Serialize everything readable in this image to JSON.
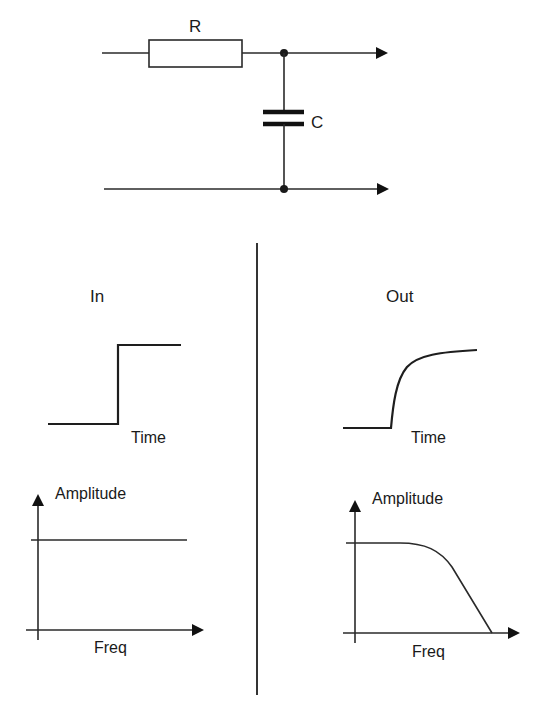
{
  "circuit": {
    "resistor_label": "R",
    "capacitor_label": "C"
  },
  "panels": {
    "input": {
      "heading": "In",
      "time_plot": {
        "x_label": "Time",
        "waveform": "step"
      },
      "freq_plot": {
        "x_label": "Freq",
        "y_label": "Amplitude",
        "response": "flat"
      }
    },
    "output": {
      "heading": "Out",
      "time_plot": {
        "x_label": "Time",
        "waveform": "exponential rise"
      },
      "freq_plot": {
        "x_label": "Freq",
        "y_label": "Amplitude",
        "response": "low-pass roll-off"
      }
    }
  },
  "colors": {
    "ink": "#1a1a1a",
    "background": "#ffffff"
  }
}
